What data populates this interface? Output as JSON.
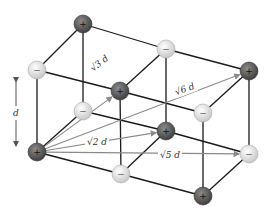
{
  "diagram": {
    "dimension_label": "d",
    "colors": {
      "cation": "#5a5a5a",
      "anion": "#ececec",
      "edge": "#1a1a1a",
      "vector": "#8a8a8a"
    },
    "ions": [
      {
        "id": "A",
        "charge": "+",
        "x": 83,
        "y": 24
      },
      {
        "id": "B",
        "charge": "−",
        "x": 166,
        "y": 49
      },
      {
        "id": "C",
        "charge": "+",
        "x": 249,
        "y": 71
      },
      {
        "id": "D",
        "charge": "−",
        "x": 37,
        "y": 70
      },
      {
        "id": "E",
        "charge": "+",
        "x": 120,
        "y": 91
      },
      {
        "id": "F",
        "charge": "−",
        "x": 203,
        "y": 113
      },
      {
        "id": "G",
        "charge": "−",
        "x": 83,
        "y": 111
      },
      {
        "id": "H",
        "charge": "+",
        "x": 166,
        "y": 131
      },
      {
        "id": "I",
        "charge": "−",
        "x": 249,
        "y": 154
      },
      {
        "id": "J",
        "charge": "+",
        "x": 37,
        "y": 152
      },
      {
        "id": "K",
        "charge": "−",
        "x": 121,
        "y": 174
      },
      {
        "id": "L",
        "charge": "+",
        "x": 203,
        "y": 196
      }
    ],
    "edges": [
      [
        "A",
        "B"
      ],
      [
        "B",
        "C"
      ],
      [
        "D",
        "E"
      ],
      [
        "E",
        "F"
      ],
      [
        "A",
        "D"
      ],
      [
        "B",
        "E"
      ],
      [
        "C",
        "F"
      ],
      [
        "G",
        "H"
      ],
      [
        "H",
        "I"
      ],
      [
        "J",
        "K"
      ],
      [
        "K",
        "L"
      ],
      [
        "G",
        "J"
      ],
      [
        "H",
        "K"
      ],
      [
        "I",
        "L"
      ],
      [
        "A",
        "G"
      ],
      [
        "B",
        "H"
      ],
      [
        "C",
        "I"
      ],
      [
        "D",
        "J"
      ],
      [
        "E",
        "K"
      ],
      [
        "F",
        "L"
      ]
    ],
    "vectors": [
      {
        "from": "J",
        "to": "E",
        "label": "√3 d",
        "label_x": 100,
        "label_y": 66,
        "label_rot": -38
      },
      {
        "from": "J",
        "to": "C",
        "label": "√6 d",
        "label_x": 185,
        "label_y": 92,
        "label_rot": -20
      },
      {
        "from": "J",
        "to": "H",
        "label": "√2 d",
        "label_x": 97,
        "label_y": 145,
        "label_rot": 0
      },
      {
        "from": "J",
        "to": "I",
        "label": "√5 d",
        "label_x": 170,
        "label_y": 158,
        "label_rot": 0
      }
    ],
    "labels": {
      "sqrt3": "√3 d",
      "sqrt6": "√6 d",
      "sqrt2": "√2 d",
      "sqrt5": "√5 d",
      "d": "d"
    }
  }
}
